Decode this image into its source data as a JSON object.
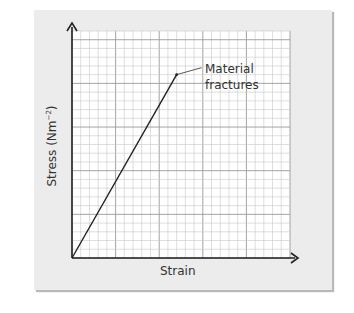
{
  "chart_data": {
    "type": "line",
    "title": "",
    "xlabel": "Strain",
    "ylabel": "Stress (Nm⁻²)",
    "series": [
      {
        "name": "Stress-strain",
        "x": [
          0,
          12
        ],
        "y": [
          0,
          21
        ]
      }
    ],
    "annotations": [
      {
        "text": "Material fractures",
        "x": 12,
        "y": 21
      }
    ],
    "grid": true,
    "xlim": [
      0,
      25
    ],
    "ylim": [
      0,
      26
    ]
  },
  "labels": {
    "annotation_line1": "Material",
    "annotation_line2": "fractures",
    "xlabel": "Strain",
    "ylabel_main": "Stress (Nm",
    "ylabel_sup": "−2",
    "ylabel_close": ")"
  }
}
